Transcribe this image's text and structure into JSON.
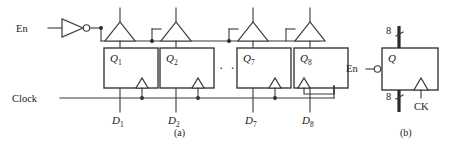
{
  "figure": {
    "captions": {
      "a": "(a)",
      "b": "(b)"
    }
  },
  "panel_a": {
    "inputs": {
      "enable_label": "En",
      "clock_label": "Clock"
    },
    "ellipsis": "· · ·",
    "flipflops": [
      {
        "q_label": "Q",
        "q_sub": "1",
        "d_label": "D",
        "d_sub": "1"
      },
      {
        "q_label": "Q",
        "q_sub": "2",
        "d_label": "D",
        "d_sub": "2"
      },
      {
        "q_label": "Q",
        "q_sub": "7",
        "d_label": "D",
        "d_sub": "7"
      },
      {
        "q_label": "Q",
        "q_sub": "8",
        "d_label": "D",
        "d_sub": "8"
      }
    ]
  },
  "panel_b": {
    "enable_label": "En",
    "q_label": "Q",
    "clock_label": "CK",
    "bus_in_width": "8",
    "bus_out_width": "8"
  },
  "colors": {
    "wire": "#3a3a3a",
    "bus": "#2a2a2a",
    "text": "#1a1a1a",
    "background": "#ffffff"
  }
}
